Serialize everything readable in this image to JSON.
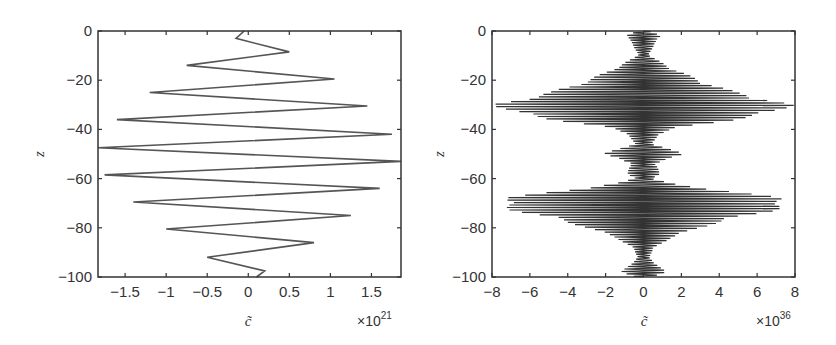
{
  "chart_data": [
    {
      "type": "line",
      "title": "",
      "xlabel": "c̃",
      "ylabel": "z",
      "x_multiplier": "×10",
      "x_exponent": "21",
      "xlim": [
        -1.83,
        1.86
      ],
      "ylim": [
        -100,
        0
      ],
      "xticks": [
        "−1.5",
        "−1",
        "−0.5",
        "0",
        "0.5",
        "1",
        "1.5"
      ],
      "xtick_values": [
        -1.5,
        -1,
        -0.5,
        0,
        0.5,
        1,
        1.5
      ],
      "yticks": [
        "0",
        "−20",
        "−40",
        "−60",
        "−80",
        "−100"
      ],
      "ytick_values": [
        0,
        -20,
        -40,
        -60,
        -80,
        -100
      ],
      "grid": false,
      "line_color": "#555555",
      "points": [
        {
          "x": -0.05,
          "z": 0
        },
        {
          "x": -0.15,
          "z": -3
        },
        {
          "x": 0.5,
          "z": -8.5
        },
        {
          "x": -0.75,
          "z": -14
        },
        {
          "x": 1.05,
          "z": -19.5
        },
        {
          "x": -1.2,
          "z": -25
        },
        {
          "x": 1.45,
          "z": -30.5
        },
        {
          "x": -1.6,
          "z": -36
        },
        {
          "x": 1.75,
          "z": -42
        },
        {
          "x": -1.83,
          "z": -47.5
        },
        {
          "x": 1.86,
          "z": -53
        },
        {
          "x": -1.75,
          "z": -58.5
        },
        {
          "x": 1.6,
          "z": -64
        },
        {
          "x": -1.4,
          "z": -69.5
        },
        {
          "x": 1.25,
          "z": -75
        },
        {
          "x": -1.0,
          "z": -80.5
        },
        {
          "x": 0.8,
          "z": -86
        },
        {
          "x": -0.5,
          "z": -92
        },
        {
          "x": 0.2,
          "z": -97.5
        },
        {
          "x": 0.1,
          "z": -100
        }
      ]
    },
    {
      "type": "line",
      "title": "",
      "xlabel": "c̃",
      "ylabel": "z",
      "x_multiplier": "×10",
      "x_exponent": "36",
      "xlim": [
        -8,
        8
      ],
      "ylim": [
        -100,
        0
      ],
      "xticks": [
        "−8",
        "−6",
        "−4",
        "−2",
        "0",
        "2",
        "4",
        "6",
        "8"
      ],
      "xtick_values": [
        -8,
        -6,
        -4,
        -2,
        0,
        2,
        4,
        6,
        8
      ],
      "yticks": [
        "0",
        "−20",
        "−40",
        "−60",
        "−80",
        "−100"
      ],
      "ytick_values": [
        0,
        -20,
        -40,
        -60,
        -80,
        -100
      ],
      "grid": false,
      "line_color": "#333333",
      "description": "Rapid oscillation with two diamond-shaped envelopes peaking near z=-30 and z=-70 at amplitude ~8, small amplitude near z=0, -50, -100",
      "envelope": [
        {
          "z": 0,
          "amp": 0.3
        },
        {
          "z": -2,
          "amp": 1.0
        },
        {
          "z": -5,
          "amp": 0.6
        },
        {
          "z": -10,
          "amp": 0.3
        },
        {
          "z": -15,
          "amp": 1.5
        },
        {
          "z": -20,
          "amp": 3.0
        },
        {
          "z": -25,
          "amp": 5.0
        },
        {
          "z": -28,
          "amp": 7.0
        },
        {
          "z": -30,
          "amp": 8.0
        },
        {
          "z": -33,
          "amp": 7.2
        },
        {
          "z": -36,
          "amp": 5.0
        },
        {
          "z": -39,
          "amp": 2.0
        },
        {
          "z": -42,
          "amp": 0.8
        },
        {
          "z": -46,
          "amp": 0.5
        },
        {
          "z": -50,
          "amp": 2.2
        },
        {
          "z": -54,
          "amp": 0.6
        },
        {
          "z": -58,
          "amp": 1.0
        },
        {
          "z": -60,
          "amp": 0.4
        },
        {
          "z": -62,
          "amp": 1.5
        },
        {
          "z": -65,
          "amp": 4.5
        },
        {
          "z": -68,
          "amp": 7.5
        },
        {
          "z": -70,
          "amp": 8.0
        },
        {
          "z": -73,
          "amp": 7.0
        },
        {
          "z": -76,
          "amp": 5.0
        },
        {
          "z": -80,
          "amp": 3.0
        },
        {
          "z": -84,
          "amp": 1.5
        },
        {
          "z": -88,
          "amp": 0.6
        },
        {
          "z": -92,
          "amp": 0.3
        },
        {
          "z": -96,
          "amp": 0.9
        },
        {
          "z": -98,
          "amp": 1.2
        },
        {
          "z": -100,
          "amp": 0.5
        }
      ],
      "oscillation_period_z": 1.0
    }
  ]
}
